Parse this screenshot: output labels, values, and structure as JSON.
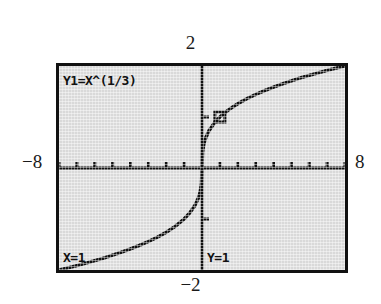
{
  "device": {
    "kind": "graphing-calculator-screen",
    "screen_bg": "#d9d9d9",
    "ink": "#111111",
    "page_bg": "#ffffff"
  },
  "axis_range_labels": {
    "x_min": "−8",
    "x_max": "8",
    "y_max": "2",
    "y_min": "−2"
  },
  "screen_overlay": {
    "function_label": "Y1=X^(1/3)",
    "trace_x_label": "X=1",
    "trace_y_label": "Y=1"
  },
  "chart_data": {
    "type": "line",
    "title": "Y1=X^(1/3)",
    "subtitle": "",
    "expression": "y = x^(1/3)",
    "xlabel": "",
    "ylabel": "",
    "xlim": [
      -8,
      8
    ],
    "ylim": [
      -2,
      2
    ],
    "grid": false,
    "legend": "none",
    "axes": {
      "x_axis_at_y": 0,
      "y_axis_at_x": 0,
      "x_tick_step": 1,
      "y_tick_step": 1,
      "x_ticks": [
        -8,
        -7,
        -6,
        -5,
        -4,
        -3,
        -2,
        -1,
        1,
        2,
        3,
        4,
        5,
        6,
        7,
        8
      ],
      "y_ticks": [
        -1,
        1
      ],
      "tick_labels_shown": false
    },
    "series": [
      {
        "name": "Y1",
        "expression": "x^(1/3)",
        "x": [
          -8,
          -7.5,
          -7,
          -6.5,
          -6,
          -5.5,
          -5,
          -4.5,
          -4,
          -3.5,
          -3,
          -2.5,
          -2,
          -1.5,
          -1,
          -0.7,
          -0.4,
          -0.2,
          -0.1,
          -0.03,
          0,
          0.03,
          0.1,
          0.2,
          0.4,
          0.7,
          1,
          1.5,
          2,
          2.5,
          3,
          3.5,
          4,
          4.5,
          5,
          5.5,
          6,
          6.5,
          7,
          7.5,
          8
        ],
        "y": [
          -2,
          -1.957,
          -1.913,
          -1.866,
          -1.817,
          -1.765,
          -1.71,
          -1.651,
          -1.587,
          -1.518,
          -1.442,
          -1.357,
          -1.26,
          -1.145,
          -1,
          -0.888,
          -0.737,
          -0.585,
          -0.464,
          -0.311,
          0,
          0.311,
          0.464,
          0.585,
          0.737,
          0.888,
          1,
          1.145,
          1.26,
          1.357,
          1.442,
          1.518,
          1.587,
          1.651,
          1.71,
          1.765,
          1.817,
          1.866,
          1.913,
          1.957,
          2
        ]
      }
    ],
    "annotations": [
      {
        "name": "trace-cursor",
        "kind": "square-marker",
        "x": 1,
        "y": 1,
        "label_x": "X=1",
        "label_y": "Y=1"
      }
    ]
  }
}
